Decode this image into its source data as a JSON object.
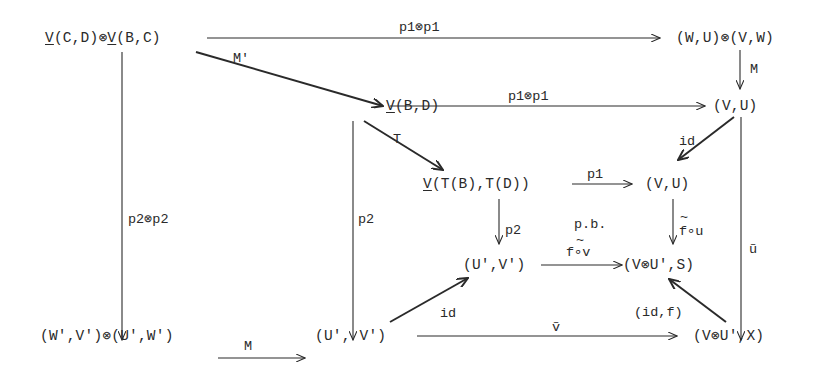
{
  "diagram": {
    "type": "commutative-diagram",
    "nodes": {
      "vcd_vbc": {
        "underlined_a": "V",
        "rest_a": "(C,D)⊗",
        "underlined_b": "V",
        "rest_b": "(B,C)"
      },
      "wu_vw": "(W,U)⊗(V,W)",
      "vbd": {
        "underlined": "V",
        "rest": "(B,D)"
      },
      "vu_top": "(V,U)",
      "vtb_td": {
        "underlined": "V",
        "rest": "(T(B),T(D))"
      },
      "vu_mid": "(V,U)",
      "upvp_mid": "(U',V')",
      "vup_s": "(V⊗U',S)",
      "wpvp_upwp": "(W',V')⊗(U',W')",
      "upvp_bot": "(U', V')",
      "vup_x": "(V⊗U',X)"
    },
    "arrows": {
      "top_p1p1": "p1⊗p1",
      "mid_p1p1": "p1⊗p1",
      "M_right": "M",
      "M_prime": "M'",
      "T": "T",
      "id_top": "id",
      "p1": "p1",
      "p2p2": "p2⊗p2",
      "p2_left": "p2",
      "p2_mid": "p2",
      "pb": "p.b.",
      "fv": "f∘v",
      "fv_tilde": "~",
      "fu": "f∘u",
      "fu_tilde": "~",
      "u_tilde": "ũ",
      "M_bottom": "M",
      "id_bottom": "id",
      "v_tilde": "ṽ",
      "id_f": "(id,f)"
    }
  }
}
